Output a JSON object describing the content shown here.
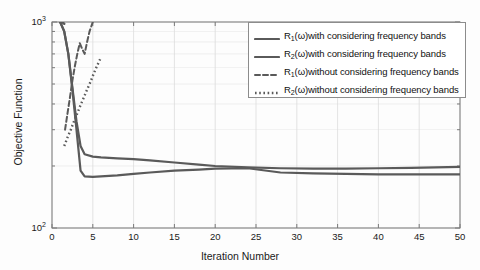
{
  "chart_data": {
    "type": "line",
    "title": "",
    "xlabel": "Iteration Number",
    "ylabel": "Objective Function",
    "xlim": [
      0,
      50
    ],
    "ylim": [
      100,
      1000
    ],
    "yscale": "log",
    "xscale": "linear",
    "grid": true,
    "legend_position": "upper right",
    "xticks": [
      "0",
      "5",
      "10",
      "15",
      "20",
      "25",
      "30",
      "35",
      "40",
      "45",
      "50"
    ],
    "xtick_values": [
      0,
      5,
      10,
      15,
      20,
      25,
      30,
      35,
      40,
      45,
      50
    ],
    "ytick_labels": [
      "10",
      "10"
    ],
    "ytick_exponents": [
      "2",
      "3"
    ],
    "ytick_values": [
      100,
      1000
    ],
    "series": [
      {
        "name": "R1-with-bands",
        "legend_html": "R<sub>1</sub>(ω)with considering frequency bands",
        "style": "solid",
        "color": "#5a5a5a",
        "width": 2.2,
        "x": [
          1,
          1.5,
          2,
          2.5,
          3,
          3.5,
          4,
          5,
          6,
          8,
          10,
          12,
          15,
          18,
          20,
          24,
          28,
          32,
          36,
          40,
          44,
          47,
          50
        ],
        "y": [
          1000,
          900,
          700,
          480,
          330,
          250,
          228,
          222,
          220,
          218,
          216,
          213,
          208,
          203,
          200,
          197,
          195,
          194,
          194,
          195,
          196,
          197,
          198
        ]
      },
      {
        "name": "R2-with-bands",
        "legend_html": "R<sub>2</sub>(ω)with considering frequency bands",
        "style": "solid",
        "color": "#5a5a5a",
        "width": 2.2,
        "x": [
          1,
          1.5,
          2,
          2.5,
          3,
          3.5,
          4,
          5,
          6,
          8,
          10,
          12,
          15,
          18,
          20,
          24,
          28,
          32,
          36,
          40,
          44,
          47,
          50
        ],
        "y": [
          1000,
          900,
          700,
          470,
          300,
          190,
          178,
          177,
          178,
          180,
          183,
          186,
          190,
          192,
          194,
          195,
          186,
          184,
          183,
          182,
          182,
          182,
          182
        ]
      },
      {
        "name": "R1-without-bands",
        "legend_html": "R<sub>1</sub>(ω)without considering frequency bands",
        "style": "dashed",
        "color": "#5a5a5a",
        "width": 2.0,
        "x": [
          1.6,
          1.9,
          2.2,
          2.5,
          2.8,
          3.1,
          3.4,
          3.7,
          4.0,
          4.3,
          4.6,
          5.0
        ],
        "y": [
          300,
          360,
          430,
          520,
          610,
          700,
          790,
          740,
          700,
          800,
          900,
          1000
        ]
      },
      {
        "name": "R2-without-bands",
        "legend_html": "R<sub>2</sub>(ω)without considering frequency bands",
        "style": "dotted",
        "color": "#5a5a5a",
        "width": 2.4,
        "x": [
          1.5,
          1.9,
          2.3,
          2.7,
          3.1,
          3.5,
          3.9,
          4.3,
          4.7,
          5.1,
          5.5,
          5.9
        ],
        "y": [
          250,
          275,
          300,
          330,
          360,
          395,
          430,
          470,
          510,
          560,
          610,
          660
        ]
      },
      {
        "name": "R-initial-drop",
        "legend_html": "",
        "style": "solid",
        "color": "#5a5a5a",
        "width": 2.4,
        "x": [
          1,
          1.2,
          1.5
        ],
        "y": [
          1000,
          1000,
          980
        ]
      }
    ]
  },
  "axes": {
    "ylabel": "Objective Function",
    "xlabel": "Iteration Number"
  },
  "colors": {
    "line": "#5a5a5a",
    "grid": "#dcdcdc",
    "frame": "#7a7a7a",
    "text": "#1a1a1a",
    "background": "#fdfdfd"
  }
}
